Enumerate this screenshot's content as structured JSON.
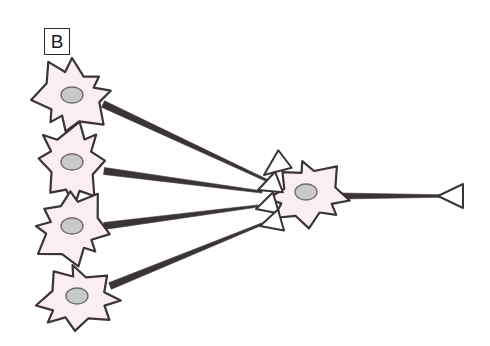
{
  "figure": {
    "panel_label": "B",
    "background_color": "#ffffff",
    "width": 490,
    "height": 346
  },
  "style": {
    "soma_fill": "#fbeef1",
    "soma_stroke": "#3a3438",
    "nucleus_fill": "#c9c9c9",
    "nucleus_stroke": "#6b6b6b",
    "axon_stroke": "#3a3438",
    "bouton_fill": "#ffffff",
    "bouton_stroke": "#3a3438"
  },
  "presynaptic_neurons": [
    {
      "id": "presynaptic-neuron-1",
      "soma_center_x": 72,
      "soma_center_y": 96,
      "soma_radius": 38,
      "nucleus_cx": 72,
      "nucleus_cy": 95,
      "nucleus_rx": 11,
      "nucleus_ry": 8,
      "axon_start_x": 103,
      "axon_start_y": 104,
      "axon_end_x": 268,
      "axon_end_y": 181
    },
    {
      "id": "presynaptic-neuron-2",
      "soma_center_x": 72,
      "soma_center_y": 164,
      "soma_radius": 38,
      "nucleus_cx": 72,
      "nucleus_cy": 162,
      "nucleus_rx": 11,
      "nucleus_ry": 8,
      "axon_start_x": 104,
      "axon_start_y": 171,
      "axon_end_x": 262,
      "axon_end_y": 192
    },
    {
      "id": "presynaptic-neuron-3",
      "soma_center_x": 72,
      "soma_center_y": 228,
      "soma_radius": 38,
      "nucleus_cx": 72,
      "nucleus_cy": 226,
      "nucleus_rx": 11,
      "nucleus_ry": 8,
      "axon_start_x": 104,
      "axon_start_y": 226,
      "axon_end_x": 258,
      "axon_end_y": 206
    },
    {
      "id": "presynaptic-neuron-4",
      "soma_center_x": 78,
      "soma_center_y": 298,
      "soma_radius": 38,
      "nucleus_cx": 77,
      "nucleus_cy": 296,
      "nucleus_rx": 11,
      "nucleus_ry": 8,
      "axon_start_x": 110,
      "axon_start_y": 286,
      "axon_end_x": 262,
      "axon_end_y": 224
    }
  ],
  "synaptic_boutons": [
    {
      "id": "bouton-1",
      "tip_x": 264,
      "tip_y": 175,
      "back_x": 285,
      "back_y": 159,
      "spread": 11
    },
    {
      "id": "bouton-2",
      "tip_x": 258,
      "tip_y": 190,
      "back_x": 279,
      "back_y": 182,
      "spread": 11
    },
    {
      "id": "bouton-3",
      "tip_x": 256,
      "tip_y": 209,
      "back_x": 276,
      "back_y": 203,
      "spread": 11
    },
    {
      "id": "bouton-4",
      "tip_x": 260,
      "tip_y": 226,
      "back_x": 281,
      "back_y": 220,
      "spread": 11
    }
  ],
  "postsynaptic_neuron": {
    "id": "postsynaptic-neuron",
    "soma_center_x": 308,
    "soma_center_y": 194,
    "soma_radius": 38,
    "nucleus_cx": 306,
    "nucleus_cy": 192,
    "nucleus_rx": 11,
    "nucleus_ry": 8,
    "axon_start_x": 340,
    "axon_start_y": 196,
    "axon_end_x": 440,
    "axon_end_y": 196,
    "terminal": {
      "id": "axon-terminal-bouton",
      "tip_x": 438,
      "tip_y": 196,
      "back_x": 463,
      "back_y": 196,
      "spread": 12
    }
  }
}
